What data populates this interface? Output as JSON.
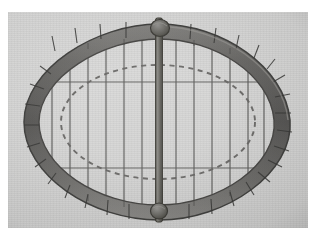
{
  "figure": {
    "kind": "archaeological-line-drawing",
    "caption_ghost": "",
    "plate": {
      "x": 8,
      "y": 12,
      "width": 300,
      "height": 216,
      "background_color": "#d5d5d4",
      "border_color": "#bdbdbc"
    },
    "palette": {
      "plate_background": "#d5d5d4",
      "rim_dark": "#595857",
      "rim_mid": "#6e6d6b",
      "rim_light": "#8a8987",
      "rim_outline": "#3a3a39",
      "spine_dark": "#4e4d4c",
      "spine_light": "#7b7a78",
      "rib_line": "#4a4a48",
      "cross_line": "#555452",
      "dashed_ellipse": "#5c5b59",
      "page_white": "#ffffff"
    },
    "geometry": {
      "rim_outer": {
        "cx": 151,
        "cy": 110,
        "rx": 139,
        "ry": 98
      },
      "rim_inner": {
        "cx": 151,
        "cy": 110,
        "rx": 124,
        "ry": 83
      },
      "rim_band_thickness": 15,
      "rim_segment_count": 28,
      "spine_x": 151,
      "spine_width": 7,
      "spine_top_y": 4,
      "spine_bottom_y": 212,
      "rib_count": 13,
      "cross_line_count": 2,
      "cross_line_y": [
        70,
        156
      ],
      "dashed_ellipse": {
        "cx": 150,
        "cy": 110,
        "rx": 97,
        "ry": 57
      },
      "joint_top": {
        "cx": 151,
        "cy": 16,
        "rx": 9,
        "ry": 9
      },
      "joint_bottom": {
        "cx": 151,
        "cy": 200,
        "rx": 8,
        "ry": 8
      }
    },
    "ribs_x": [
      44,
      62,
      80,
      98,
      116,
      134,
      151,
      168,
      186,
      204,
      222,
      240,
      258
    ],
    "labels": {
      "rim": "segmented-outer-rim",
      "spine": "central-spine",
      "ribs": "transverse-ribs",
      "cross_lines": "longitudinal-stringers",
      "inner_outline": "dashed-inner-outline"
    }
  }
}
